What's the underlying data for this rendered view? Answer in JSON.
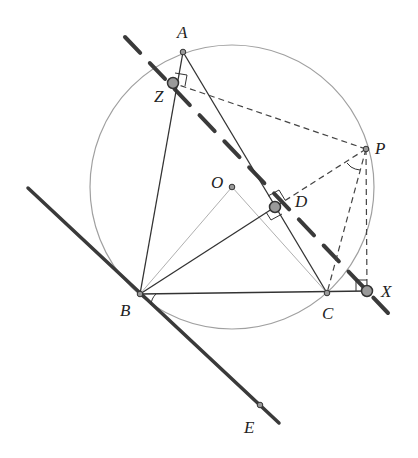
{
  "diagram": {
    "points": {
      "A": {
        "label": "A",
        "x": 183,
        "y": 52,
        "lx": 177,
        "ly": 38
      },
      "B": {
        "label": "B",
        "x": 140,
        "y": 294,
        "lx": 120,
        "ly": 316
      },
      "C": {
        "label": "C",
        "x": 327,
        "y": 293,
        "lx": 322,
        "ly": 319
      },
      "O": {
        "label": "O",
        "x": 232,
        "y": 187,
        "lx": 211,
        "ly": 188
      },
      "P": {
        "label": "P",
        "x": 366,
        "y": 149,
        "lx": 375,
        "ly": 154
      },
      "Z": {
        "label": "Z",
        "x": 173,
        "y": 83,
        "lx": 154,
        "ly": 102
      },
      "D": {
        "label": "D",
        "x": 275,
        "y": 207,
        "lx": 295,
        "ly": 207
      },
      "X": {
        "label": "X",
        "x": 367,
        "y": 291,
        "lx": 381,
        "ly": 297
      },
      "E": {
        "label": "E",
        "x": 260,
        "y": 405,
        "lx": 244,
        "ly": 433
      }
    },
    "circumcircle": {
      "cx": 232,
      "cy": 187,
      "r": 142,
      "color": "#9a9a9a"
    },
    "simson_line": {
      "x1": 125,
      "y1": 37,
      "x2": 388,
      "y2": 313,
      "color": "#3a3a3a",
      "style": "dashed-thick"
    },
    "tangent_line": {
      "x1": 28,
      "y1": 188,
      "x2": 279,
      "y2": 423,
      "color": "#3a3a3a"
    },
    "colors": {
      "stroke": "#333333",
      "light": "#9a9a9a",
      "point_fill": "#9a9a9a",
      "label": "#222222"
    }
  }
}
